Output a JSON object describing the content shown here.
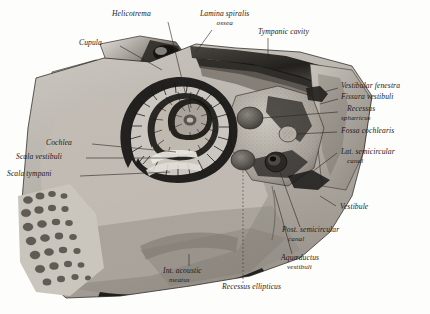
{
  "plate": {
    "title": "Interior of the right osseous labyrinth (bony labyrinth of the ear)",
    "medium": "grayscale anatomical engraving",
    "background_color": "#fdfdfb",
    "ink_color": "#1b1b1b"
  },
  "labels": [
    {
      "id": "helicotrema",
      "text": "Helicotrema",
      "sub": "",
      "x": 112,
      "y": 12,
      "align": "left",
      "leader": [
        [
          168,
          22
        ],
        [
          190,
          86
        ]
      ]
    },
    {
      "id": "lamina-spiralis",
      "text": "Lamina spiralis",
      "sub": "ossea",
      "x": 200,
      "y": 12,
      "align": "left",
      "leader": [
        [
          212,
          30
        ],
        [
          196,
          50
        ]
      ]
    },
    {
      "id": "tympanic-cavity",
      "text": "Tympanic cavity",
      "sub": "",
      "x": 258,
      "y": 30,
      "align": "left",
      "leader": [
        [
          268,
          38
        ],
        [
          268,
          60
        ]
      ]
    },
    {
      "id": "cupula",
      "text": "Cupula",
      "sub": "",
      "x": 79,
      "y": 40,
      "align": "left",
      "leader": [
        [
          118,
          46
        ],
        [
          160,
          72
        ]
      ]
    },
    {
      "id": "vestibular-fenestra",
      "text": "Vestibular fenestra",
      "sub": "",
      "x": 340,
      "y": 84,
      "align": "left",
      "leader": [
        [
          338,
          88
        ],
        [
          322,
          92
        ]
      ]
    },
    {
      "id": "fissura-vestibuli",
      "text": "Fissura vestibuli",
      "sub": "",
      "x": 340,
      "y": 95,
      "align": "left",
      "leader": [
        [
          338,
          99
        ],
        [
          318,
          104
        ]
      ]
    },
    {
      "id": "recessus-sphaericus",
      "text": "Recessus",
      "sub": "sphæricus",
      "x": 345,
      "y": 107,
      "align": "left",
      "leader": [
        [
          338,
          112
        ],
        [
          252,
          118
        ]
      ]
    },
    {
      "id": "fossa-cochlearis",
      "text": "Fossa cochlearis",
      "sub": "",
      "x": 340,
      "y": 129,
      "align": "left",
      "leader": [
        [
          337,
          132
        ],
        [
          290,
          135
        ]
      ]
    },
    {
      "id": "lat-semicircular",
      "text": "Lat. semicircular",
      "sub": "canal",
      "x": 340,
      "y": 150,
      "align": "left",
      "leader": [
        [
          337,
          153
        ],
        [
          300,
          160
        ]
      ]
    },
    {
      "id": "cochlea",
      "text": "Cochlea",
      "sub": "",
      "x": 46,
      "y": 140,
      "align": "left",
      "leader": [
        [
          92,
          144
        ],
        [
          175,
          150
        ]
      ]
    },
    {
      "id": "scala-vestibuli",
      "text": "Scala vestibuli",
      "sub": "",
      "x": 16,
      "y": 154,
      "align": "left",
      "leader": [
        [
          86,
          158
        ],
        [
          172,
          158
        ]
      ]
    },
    {
      "id": "scala-tympani",
      "text": "Scala tympani",
      "sub": "",
      "x": 8,
      "y": 172,
      "align": "left",
      "leader": [
        [
          80,
          176
        ],
        [
          170,
          172
        ]
      ]
    },
    {
      "id": "vestibule",
      "text": "Vestibule",
      "sub": "",
      "x": 338,
      "y": 205,
      "align": "left",
      "leader": [
        [
          336,
          207
        ],
        [
          322,
          200
        ]
      ]
    },
    {
      "id": "post-semicircular",
      "text": "Post. semicircular",
      "sub": "canal",
      "x": 282,
      "y": 228,
      "align": "left",
      "leader": [
        [
          300,
          228
        ],
        [
          292,
          214
        ]
      ]
    },
    {
      "id": "aquaeductus",
      "text": "Aquæductus",
      "sub": "vestibuli",
      "x": 281,
      "y": 256,
      "align": "left",
      "leader": [
        [
          290,
          256
        ],
        [
          276,
          200
        ]
      ]
    },
    {
      "id": "int-acoustic-meatus",
      "text": "Int. acoustic",
      "sub": "meatus",
      "x": 163,
      "y": 269,
      "align": "left",
      "leader": [
        [
          189,
          267
        ],
        [
          189,
          256
        ]
      ]
    },
    {
      "id": "recessus-ellipticus",
      "text": "Recessus ellipticus",
      "sub": "",
      "x": 222,
      "y": 285,
      "align": "left",
      "leader": [
        [
          243,
          284
        ],
        [
          243,
          170
        ]
      ]
    }
  ]
}
